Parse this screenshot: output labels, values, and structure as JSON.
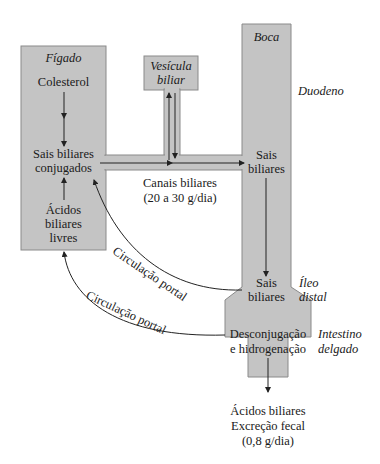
{
  "colors": {
    "fill": "#c4c4c4",
    "stroke": "#8a8a8a",
    "line": "#333333",
    "text": "#1a1a1a"
  },
  "liver": {
    "title": "Fígado",
    "cholesterol": "Colesterol",
    "conjugated_1": "Sais biliares",
    "conjugated_2": "conjugados",
    "free_1": "Ácidos",
    "free_2": "biliares",
    "free_3": "livres"
  },
  "gallbladder": {
    "line1": "Vesícula",
    "line2": "biliar"
  },
  "intestine": {
    "mouth": "Boca",
    "duodenum": "Duodeno",
    "salts_duodenum_1": "Sais",
    "salts_duodenum_2": "biliares",
    "salts_ileum_1": "Sais",
    "salts_ileum_2": "biliares",
    "ileum_1": "Íleo",
    "ileum_2": "distal",
    "process_1": "Desconjugação",
    "process_2": "e hidrogenação",
    "small_int_1": "Intestino",
    "small_int_2": "delgado"
  },
  "ducts": {
    "label_1": "Canais biliares",
    "label_2": "(20 a 30 g/dia)"
  },
  "portal": {
    "upper": "Circulação portal",
    "lower": "Circulação portal"
  },
  "excretion": {
    "line1": "Ácidos biliares",
    "line2": "Excreção fecal",
    "line3": "(0,8 g/dia)"
  }
}
